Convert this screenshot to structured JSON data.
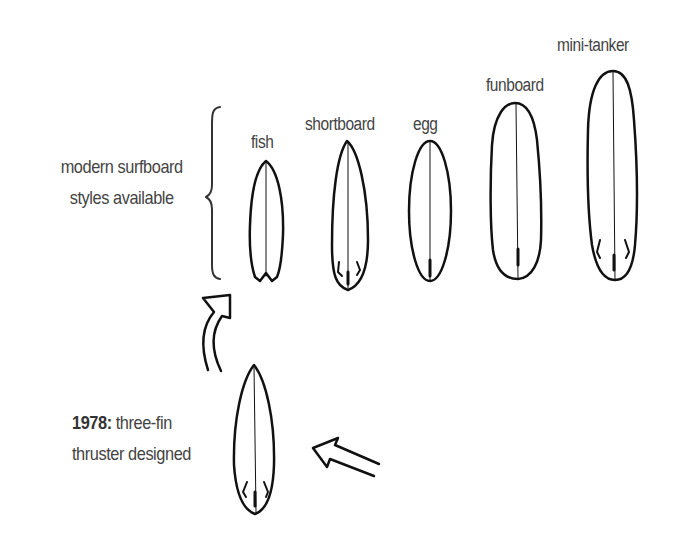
{
  "diagram": {
    "group_label": [
      "modern surfboard",
      "styles available"
    ],
    "boards": [
      {
        "name": "fish"
      },
      {
        "name": "shortboard"
      },
      {
        "name": "egg"
      },
      {
        "name": "funboard"
      },
      {
        "name": "mini-tanker"
      }
    ],
    "origin": {
      "year": "1978:",
      "line1_rest": " three-fin",
      "line2": "thruster designed"
    },
    "colors": {
      "ink": "#111111",
      "text": "#444444"
    }
  }
}
